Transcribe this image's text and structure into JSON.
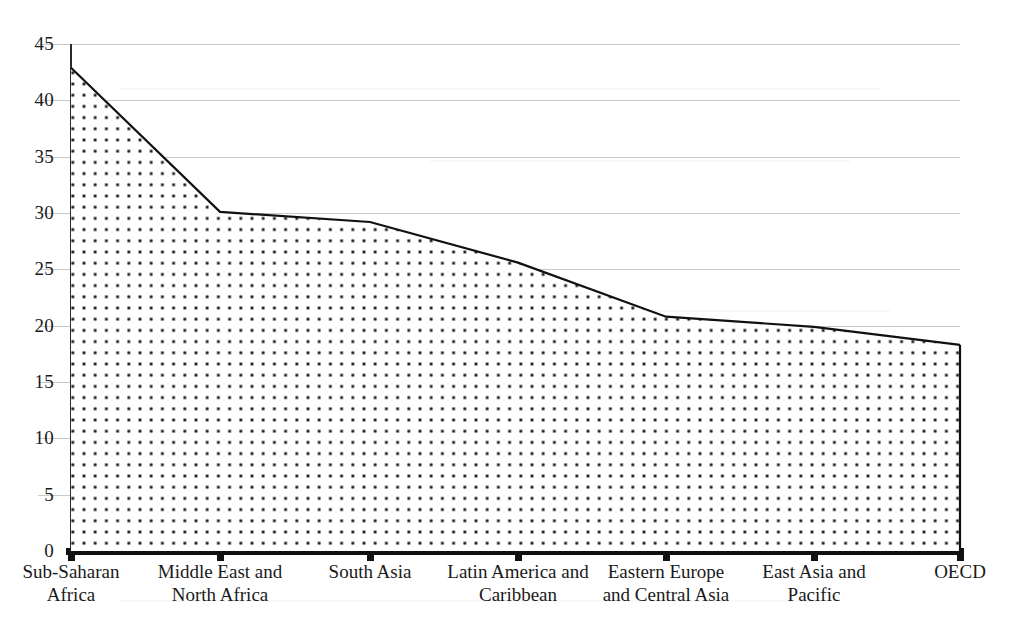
{
  "chart_data": {
    "type": "area",
    "title": "",
    "subtitle": "",
    "xlabel": "",
    "ylabel": "",
    "categories": [
      "Sub-Saharan\nAfrica",
      "Middle East and\nNorth Africa",
      "South Asia",
      "Latin America and\nCaribbean",
      "Eastern Europe\nand Central Asia",
      "East Asia and\nPacific",
      "OECD"
    ],
    "values": [
      42.9,
      30.1,
      29.2,
      25.6,
      20.8,
      19.9,
      18.3
    ],
    "ylim": [
      0,
      45
    ],
    "ytick_values": [
      0,
      5,
      10,
      15,
      20,
      25,
      30,
      35,
      40,
      45
    ],
    "ytick_labels": [
      "0",
      "5",
      "10",
      "15",
      "20",
      "25",
      "30",
      "35",
      "40",
      "45"
    ],
    "grid": true,
    "grid_axis": "y",
    "legend": false,
    "legend_position": "none",
    "series": [
      {
        "name": "",
        "values": [
          42.9,
          30.1,
          29.2,
          25.6,
          20.8,
          19.9,
          18.3
        ],
        "fill": "dotted-pattern",
        "fill_color": "#ffffff",
        "dot_color": "#1a1a1a",
        "line_color": "#111111"
      }
    ],
    "annotations": []
  },
  "axes": {
    "y_axis_color": "#2a2a2a",
    "x_axis_color": "#111111",
    "gridline_color": "#c9c9c9",
    "background": "#ffffff"
  }
}
